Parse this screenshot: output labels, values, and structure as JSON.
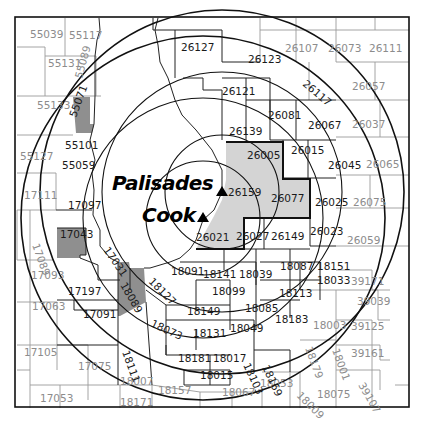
{
  "map": {
    "sites": [
      {
        "name": "Palisades",
        "marker": "triangle",
        "x": 222,
        "y": 192,
        "label_x": 112,
        "label_y": 190
      },
      {
        "name": "Cook",
        "marker": "triangle",
        "x": 203,
        "y": 218,
        "label_x": 142,
        "label_y": 222
      }
    ],
    "colors": {
      "background": "#ffffff",
      "border": "#111111",
      "inner_zone_fill": "#d4d4d4",
      "outer_zone_fill": "#8f8f8f",
      "label_dark": "#1a1a1a",
      "label_light": "#8c8c8c"
    },
    "counties_inner_zone": [
      {
        "code": "26005",
        "x": 247,
        "y": 159
      },
      {
        "code": "26159",
        "x": 228,
        "y": 196
      },
      {
        "code": "26077",
        "x": 271,
        "y": 202
      },
      {
        "code": "26021",
        "x": 196,
        "y": 241
      }
    ],
    "counties_outer_zone_shaded": [
      {
        "code": "55071",
        "x": 76,
        "y": 118,
        "rotate": -70
      },
      {
        "code": "17043",
        "x": 60,
        "y": 238
      },
      {
        "code": "18089",
        "x": 120,
        "y": 285,
        "rotate": 60
      }
    ],
    "counties_dark": [
      {
        "code": "26127",
        "x": 181,
        "y": 51
      },
      {
        "code": "26123",
        "x": 248,
        "y": 63
      },
      {
        "code": "26117",
        "x": 302,
        "y": 85,
        "rotate": 40
      },
      {
        "code": "26121",
        "x": 222,
        "y": 95
      },
      {
        "code": "26081",
        "x": 268,
        "y": 119
      },
      {
        "code": "26067",
        "x": 308,
        "y": 129
      },
      {
        "code": "26139",
        "x": 229,
        "y": 135
      },
      {
        "code": "26015",
        "x": 291,
        "y": 154
      },
      {
        "code": "26045",
        "x": 328,
        "y": 169
      },
      {
        "code": "26025",
        "x": 315,
        "y": 206
      },
      {
        "code": "26027",
        "x": 236,
        "y": 240
      },
      {
        "code": "26149",
        "x": 271,
        "y": 240
      },
      {
        "code": "26023",
        "x": 310,
        "y": 235
      },
      {
        "code": "55101",
        "x": 65,
        "y": 149
      },
      {
        "code": "55059",
        "x": 62,
        "y": 169
      },
      {
        "code": "17097",
        "x": 68,
        "y": 209
      },
      {
        "code": "17031",
        "x": 103,
        "y": 250,
        "rotate": 55
      },
      {
        "code": "17197",
        "x": 68,
        "y": 295
      },
      {
        "code": "17091",
        "x": 83,
        "y": 318
      },
      {
        "code": "18127",
        "x": 148,
        "y": 282,
        "rotate": 45
      },
      {
        "code": "18091",
        "x": 171,
        "y": 275
      },
      {
        "code": "18141",
        "x": 203,
        "y": 278
      },
      {
        "code": "18039",
        "x": 239,
        "y": 278
      },
      {
        "code": "18087",
        "x": 280,
        "y": 270
      },
      {
        "code": "18151",
        "x": 317,
        "y": 270
      },
      {
        "code": "18033",
        "x": 317,
        "y": 284
      },
      {
        "code": "18099",
        "x": 212,
        "y": 295
      },
      {
        "code": "18113",
        "x": 279,
        "y": 297
      },
      {
        "code": "18149",
        "x": 187,
        "y": 315
      },
      {
        "code": "18085",
        "x": 245,
        "y": 312
      },
      {
        "code": "18073",
        "x": 150,
        "y": 326,
        "rotate": 25
      },
      {
        "code": "18131",
        "x": 193,
        "y": 337
      },
      {
        "code": "18049",
        "x": 230,
        "y": 332
      },
      {
        "code": "18183",
        "x": 275,
        "y": 323
      },
      {
        "code": "18111",
        "x": 122,
        "y": 352,
        "rotate": 70
      },
      {
        "code": "18181",
        "x": 178,
        "y": 362
      },
      {
        "code": "18017",
        "x": 213,
        "y": 362
      },
      {
        "code": "18103",
        "x": 243,
        "y": 365,
        "rotate": 65
      },
      {
        "code": "18169",
        "x": 262,
        "y": 367,
        "rotate": 65
      },
      {
        "code": "18015",
        "x": 200,
        "y": 379
      }
    ],
    "counties_light": [
      {
        "code": "55039",
        "x": 30,
        "y": 38
      },
      {
        "code": "55117",
        "x": 69,
        "y": 39
      },
      {
        "code": "55131",
        "x": 48,
        "y": 67
      },
      {
        "code": "55089",
        "x": 82,
        "y": 79,
        "rotate": -75
      },
      {
        "code": "55133",
        "x": 37,
        "y": 109
      },
      {
        "code": "55127",
        "x": 20,
        "y": 160
      },
      {
        "code": "17111",
        "x": 24,
        "y": 199
      },
      {
        "code": "17089",
        "x": 32,
        "y": 245,
        "rotate": 70
      },
      {
        "code": "17093",
        "x": 31,
        "y": 279
      },
      {
        "code": "17063",
        "x": 32,
        "y": 310
      },
      {
        "code": "17105",
        "x": 24,
        "y": 356
      },
      {
        "code": "17075",
        "x": 78,
        "y": 370
      },
      {
        "code": "17053",
        "x": 40,
        "y": 402
      },
      {
        "code": "18007",
        "x": 120,
        "y": 385
      },
      {
        "code": "18171",
        "x": 120,
        "y": 406
      },
      {
        "code": "18157",
        "x": 158,
        "y": 394
      },
      {
        "code": "18067",
        "x": 222,
        "y": 396
      },
      {
        "code": "18053",
        "x": 260,
        "y": 387
      },
      {
        "code": "18179",
        "x": 305,
        "y": 348,
        "rotate": 70
      },
      {
        "code": "18001",
        "x": 332,
        "y": 350,
        "rotate": 70
      },
      {
        "code": "18009",
        "x": 296,
        "y": 396,
        "rotate": 45
      },
      {
        "code": "18075",
        "x": 317,
        "y": 398
      },
      {
        "code": "18003",
        "x": 313,
        "y": 329
      },
      {
        "code": "39171",
        "x": 351,
        "y": 285
      },
      {
        "code": "39039",
        "x": 357,
        "y": 305
      },
      {
        "code": "39125",
        "x": 351,
        "y": 330
      },
      {
        "code": "39161",
        "x": 351,
        "y": 357
      },
      {
        "code": "39107",
        "x": 358,
        "y": 385,
        "rotate": 60
      },
      {
        "code": "26059",
        "x": 347,
        "y": 244
      },
      {
        "code": "26075",
        "x": 353,
        "y": 206
      },
      {
        "code": "26065",
        "x": 366,
        "y": 168
      },
      {
        "code": "26037",
        "x": 352,
        "y": 128
      },
      {
        "code": "26057",
        "x": 352,
        "y": 90
      },
      {
        "code": "26107",
        "x": 285,
        "y": 52
      },
      {
        "code": "26073",
        "x": 328,
        "y": 52
      },
      {
        "code": "26111",
        "x": 369,
        "y": 52
      }
    ]
  }
}
